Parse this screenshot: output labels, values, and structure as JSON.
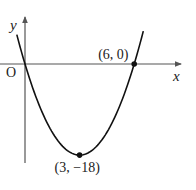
{
  "chart_data": {
    "type": "line",
    "title": "",
    "xlabel": "x",
    "ylabel": "y",
    "origin_label": "O",
    "function": "y = 2x^2 - 12x",
    "xlim": [
      -1.4,
      8.5
    ],
    "ylim": [
      -22,
      9
    ],
    "grid": false,
    "legend": "none",
    "series": [
      {
        "name": "parabola",
        "x": [
          -0.45,
          0,
          1,
          2,
          3,
          4,
          5,
          6,
          6.5
        ],
        "y": [
          5.8,
          0,
          -10,
          -16,
          -18,
          -16,
          -10,
          0,
          6.5
        ]
      }
    ],
    "annotations": [
      {
        "label": "(6, 0)",
        "x": 6,
        "y": 0,
        "marker": true,
        "position": "above-left"
      },
      {
        "label": "(3, −18)",
        "x": 3,
        "y": -18,
        "marker": true,
        "position": "below"
      }
    ],
    "colors": {
      "curve": "#111111",
      "axes": "#555555",
      "text": "#222222"
    }
  }
}
